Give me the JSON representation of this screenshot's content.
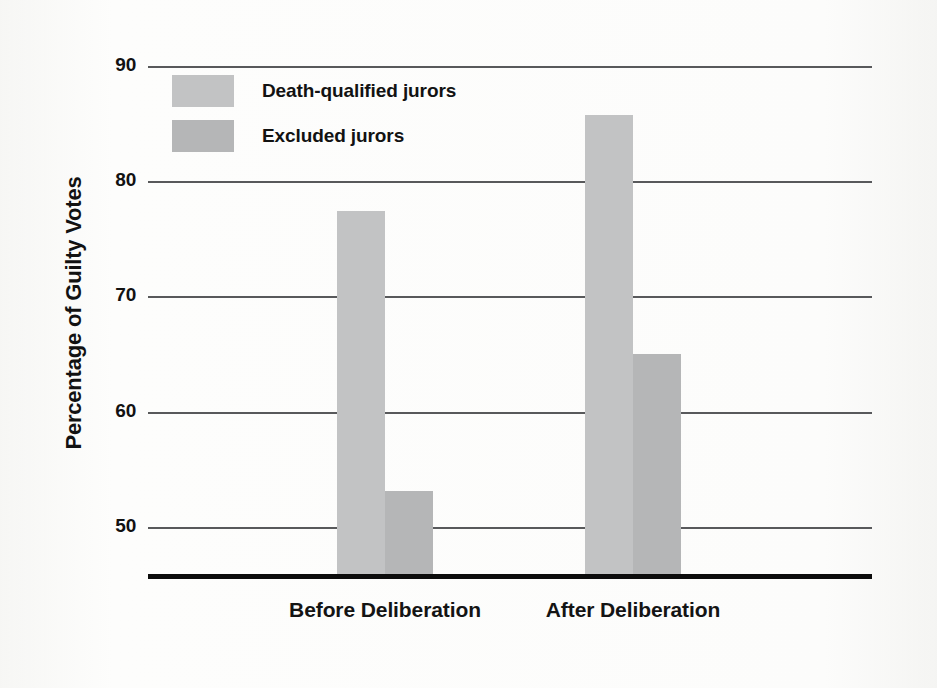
{
  "chart_data": {
    "type": "bar",
    "title": "",
    "xlabel": "",
    "ylabel": "Percentage of Guilty Votes",
    "categories": [
      "Before Deliberation",
      "After Deliberation"
    ],
    "series": [
      {
        "name": "Death-qualified jurors",
        "values": [
          77.5,
          85.8
        ],
        "color": "#c2c3c4"
      },
      {
        "name": "Excluded jurors",
        "values": [
          53.2,
          65.1
        ],
        "color": "#b5b6b7"
      }
    ],
    "ylim": [
      46,
      90
    ],
    "yticks": [
      50,
      60,
      70,
      80,
      90
    ],
    "ytick_labels": [
      "50",
      "60",
      "70",
      "80",
      "90"
    ],
    "grid": true,
    "legend_position": "upper-left-inside",
    "axis_color": "#58595b",
    "baseline_color": "#0c0c0c",
    "background": "#fdfdfc"
  },
  "legend": {
    "items": [
      {
        "label": "Death-qualified jurors"
      },
      {
        "label": "Excluded jurors"
      }
    ]
  }
}
